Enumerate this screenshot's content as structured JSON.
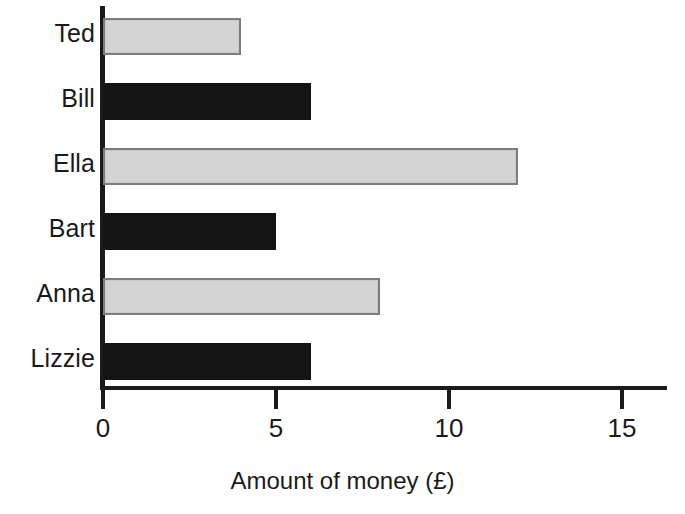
{
  "chart_data": {
    "type": "bar",
    "orientation": "horizontal",
    "title": "",
    "xlabel": "Amount of money (£)",
    "ylabel": "",
    "categories": [
      "Ted",
      "Bill",
      "Ella",
      "Bart",
      "Anna",
      "Lizzie"
    ],
    "values": [
      4,
      6,
      12,
      5,
      8,
      6
    ],
    "bar_colors": [
      "grey",
      "black",
      "grey",
      "black",
      "grey",
      "black"
    ],
    "xlim": [
      0,
      16.3
    ],
    "xticks": [
      0,
      5,
      10,
      15
    ],
    "xtick_labels": [
      "0",
      "5",
      "10",
      "15"
    ],
    "grid": false,
    "legend": null,
    "bars": [
      {
        "label": "Ted",
        "value": 4,
        "color": "grey"
      },
      {
        "label": "Bill",
        "value": 6,
        "color": "black"
      },
      {
        "label": "Ella",
        "value": 12,
        "color": "grey"
      },
      {
        "label": "Bart",
        "value": 5,
        "color": "black"
      },
      {
        "label": "Anna",
        "value": 8,
        "color": "grey"
      },
      {
        "label": "Lizzie",
        "value": 6,
        "color": "black"
      }
    ]
  },
  "colors": {
    "grey_fill": "#d4d4d4",
    "grey_edge": "#7d7d7d",
    "black_fill": "#141414",
    "axis": "#1a1a1a",
    "background": "#ffffff"
  }
}
